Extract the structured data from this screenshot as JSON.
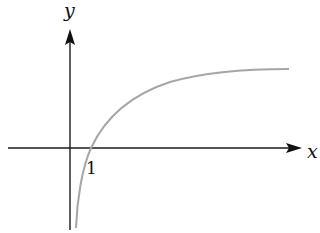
{
  "figure": {
    "x_axis_label": "x",
    "y_axis_label": "y",
    "tick_label": "1",
    "colors": {
      "axes": "#1a1a1a",
      "curve": "#a6a6a6",
      "background": "#ffffff"
    }
  }
}
